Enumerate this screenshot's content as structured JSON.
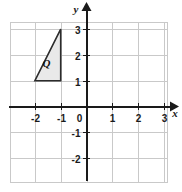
{
  "chart_data": {
    "type": "scatter",
    "title": "",
    "xlabel": "x",
    "ylabel": "y",
    "grid": true,
    "legend": null,
    "xlim": [
      -2.95,
      3.15
    ],
    "ylim": [
      -2.95,
      3.25
    ],
    "x_ticks": [
      -2,
      -1,
      0,
      1,
      2,
      3
    ],
    "y_ticks": [
      -2,
      -1,
      1,
      2,
      3
    ],
    "x_tick_labels": [
      "-2",
      "-1",
      "0",
      "1",
      "2",
      "3"
    ],
    "y_tick_labels": [
      "-2",
      "-1",
      "1",
      "2",
      "3"
    ],
    "origin_label": "0",
    "shapes": [
      {
        "name": "Q",
        "label": "Q",
        "kind": "triangle",
        "vertices": [
          [
            -2,
            1
          ],
          [
            -1,
            1
          ],
          [
            -1,
            3
          ]
        ],
        "label_position": [
          -1.55,
          1.52
        ],
        "fill": "#e9e9e9",
        "stroke": "#2b2b2b"
      }
    ]
  },
  "axes": {
    "x_axis_name": "x",
    "y_axis_name": "y",
    "axis_color": "#1a1a1a",
    "grid_color": "#c9c9c9"
  },
  "ticks": {
    "x": [
      {
        "value": -2,
        "label": "-2"
      },
      {
        "value": -1,
        "label": "-1"
      },
      {
        "value": 0,
        "label": "0"
      },
      {
        "value": 1,
        "label": "1"
      },
      {
        "value": 2,
        "label": "2"
      },
      {
        "value": 3,
        "label": "3"
      }
    ],
    "y": [
      {
        "value": 3,
        "label": "3"
      },
      {
        "value": 2,
        "label": "2"
      },
      {
        "value": 1,
        "label": "1"
      },
      {
        "value": -1,
        "label": "-1"
      },
      {
        "value": -2,
        "label": "-2"
      }
    ]
  }
}
